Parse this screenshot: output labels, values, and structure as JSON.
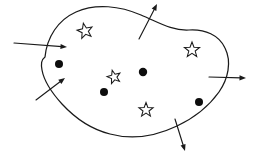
{
  "figure": {
    "canvas": {
      "width": 256,
      "height": 156
    },
    "background_color": "#ffffff",
    "line_color": "#1a1a1a",
    "boundary": {
      "name": "gaussian-surface-boundary",
      "stroke_color": "#1a1a1a",
      "stroke_width": 1.25,
      "fill": "none",
      "path": "M 45,57 C 47,37 58,20 76,12 C 96,3 120,6 141,15 C 158,22 172,31 189,30 C 205,29 219,35 225,48 C 232,62 228,79 219,92 C 209,106 194,118 177,126 C 156,136 132,140 110,134 C 90,129 74,117 62,104 C 52,93 44,81 42,70 C 41,64 41,60 45,57 Z"
    },
    "charges": {
      "negative_label": "filled-dot",
      "positive_label": "open-star",
      "dots": [
        {
          "name": "charge-dot-1",
          "cx": 59,
          "cy": 64,
          "r": 4.0,
          "color": "#0d0d0d"
        },
        {
          "name": "charge-dot-2",
          "cx": 143,
          "cy": 72,
          "r": 4.2,
          "color": "#0d0d0d"
        },
        {
          "name": "charge-dot-3",
          "cx": 104,
          "cy": 92,
          "r": 4.0,
          "color": "#0d0d0d"
        },
        {
          "name": "charge-dot-4",
          "cx": 199,
          "cy": 102,
          "r": 4.0,
          "color": "#0d0d0d"
        }
      ],
      "stars": [
        {
          "name": "charge-star-1",
          "cx": 85,
          "cy": 31,
          "r": 8.0,
          "rotation": -12
        },
        {
          "name": "charge-star-2",
          "cx": 192,
          "cy": 50,
          "r": 8.0,
          "rotation": 0
        },
        {
          "name": "charge-star-3",
          "cx": 114,
          "cy": 77,
          "r": 7.0,
          "rotation": -15
        },
        {
          "name": "charge-star-4",
          "cx": 146,
          "cy": 110,
          "r": 7.5,
          "rotation": 0
        }
      ]
    },
    "arrows": [
      {
        "name": "flux-arrow-inbound-left",
        "x1": 14,
        "y1": 43,
        "x2": 67,
        "y2": 47,
        "direction": "inward"
      },
      {
        "name": "flux-arrow-inbound-lower-left",
        "x1": 36,
        "y1": 100,
        "x2": 65,
        "y2": 78,
        "direction": "inward"
      },
      {
        "name": "flux-arrow-outbound-top",
        "x1": 139,
        "y1": 39,
        "x2": 157,
        "y2": 4,
        "direction": "outward"
      },
      {
        "name": "flux-arrow-outbound-right",
        "x1": 209,
        "y1": 77,
        "x2": 246,
        "y2": 78,
        "direction": "outward"
      },
      {
        "name": "flux-arrow-outbound-bottom",
        "x1": 175,
        "y1": 119,
        "x2": 185,
        "y2": 151,
        "direction": "outward"
      }
    ]
  }
}
